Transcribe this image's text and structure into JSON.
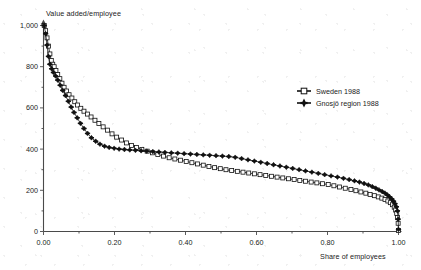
{
  "chart_data": {
    "type": "line",
    "title": "",
    "subtitle": "",
    "xlabel": "Share of employees",
    "ylabel": "Value added/employee",
    "xlim": [
      0.0,
      1.0
    ],
    "ylim": [
      0,
      1000
    ],
    "grid": false,
    "legend_position": "upper-right-inside",
    "xticks": [
      0.0,
      0.2,
      0.4,
      0.6,
      0.8,
      1.0
    ],
    "xtick_labels": [
      "0.00",
      "0.20",
      "0.40",
      "0.60",
      "0.80",
      "1.00"
    ],
    "yticks": [
      0,
      200,
      400,
      600,
      800,
      1000
    ],
    "ytick_labels": [
      "0",
      "200",
      "400",
      "600",
      "800",
      "1,000"
    ],
    "xminorticks": [
      0.1,
      0.3,
      0.5,
      0.7,
      0.9
    ],
    "yminorticks": [
      100,
      300,
      500,
      700,
      900
    ],
    "series": [
      {
        "name": "Sweden 1988",
        "marker": "open-square",
        "color": "#1d1d1d",
        "x": [
          0.002,
          0.006,
          0.01,
          0.014,
          0.018,
          0.022,
          0.026,
          0.03,
          0.035,
          0.04,
          0.046,
          0.052,
          0.058,
          0.065,
          0.072,
          0.08,
          0.088,
          0.096,
          0.105,
          0.114,
          0.124,
          0.134,
          0.145,
          0.156,
          0.168,
          0.18,
          0.193,
          0.206,
          0.22,
          0.234,
          0.248,
          0.262,
          0.277,
          0.292,
          0.307,
          0.322,
          0.338,
          0.354,
          0.37,
          0.386,
          0.402,
          0.418,
          0.434,
          0.45,
          0.466,
          0.482,
          0.498,
          0.514,
          0.53,
          0.546,
          0.562,
          0.578,
          0.594,
          0.61,
          0.626,
          0.642,
          0.658,
          0.674,
          0.69,
          0.706,
          0.722,
          0.738,
          0.754,
          0.77,
          0.786,
          0.802,
          0.818,
          0.834,
          0.85,
          0.866,
          0.88,
          0.894,
          0.908,
          0.92,
          0.932,
          0.943,
          0.953,
          0.962,
          0.97,
          0.977,
          0.983,
          0.988,
          0.992,
          0.995,
          0.997,
          0.999,
          1.0
        ],
        "y": [
          1000,
          975,
          940,
          900,
          862,
          830,
          812,
          800,
          782,
          762,
          742,
          720,
          700,
          682,
          664,
          648,
          630,
          614,
          598,
          584,
          570,
          556,
          540,
          524,
          508,
          492,
          474,
          458,
          444,
          430,
          418,
          408,
          398,
          390,
          382,
          374,
          366,
          358,
          352,
          346,
          340,
          334,
          328,
          322,
          316,
          310,
          305,
          300,
          296,
          292,
          288,
          284,
          280,
          276,
          272,
          268,
          264,
          260,
          256,
          252,
          248,
          244,
          240,
          236,
          232,
          228,
          222,
          216,
          210,
          204,
          198,
          192,
          186,
          180,
          174,
          168,
          162,
          155,
          148,
          140,
          130,
          118,
          104,
          88,
          68,
          40,
          5
        ]
      },
      {
        "name": "Gnosjö region 1988",
        "marker": "filled-plus",
        "color": "#111111",
        "x": [
          0.002,
          0.006,
          0.01,
          0.014,
          0.018,
          0.023,
          0.028,
          0.034,
          0.04,
          0.047,
          0.054,
          0.062,
          0.07,
          0.078,
          0.086,
          0.095,
          0.104,
          0.114,
          0.124,
          0.135,
          0.147,
          0.159,
          0.172,
          0.185,
          0.199,
          0.213,
          0.228,
          0.243,
          0.259,
          0.275,
          0.291,
          0.308,
          0.325,
          0.342,
          0.36,
          0.378,
          0.396,
          0.414,
          0.432,
          0.45,
          0.468,
          0.486,
          0.504,
          0.522,
          0.54,
          0.558,
          0.576,
          0.594,
          0.612,
          0.63,
          0.648,
          0.666,
          0.684,
          0.702,
          0.72,
          0.738,
          0.756,
          0.774,
          0.792,
          0.81,
          0.828,
          0.845,
          0.861,
          0.876,
          0.89,
          0.903,
          0.915,
          0.926,
          0.936,
          0.945,
          0.954,
          0.962,
          0.969,
          0.975,
          0.981,
          0.986,
          0.99,
          0.994,
          0.997,
          0.999,
          1.0
        ],
        "y": [
          1000,
          960,
          905,
          850,
          812,
          790,
          772,
          755,
          735,
          710,
          685,
          660,
          632,
          604,
          578,
          552,
          525,
          500,
          476,
          455,
          438,
          424,
          414,
          408,
          404,
          400,
          398,
          396,
          394,
          392,
          390,
          388,
          386,
          384,
          382,
          380,
          378,
          376,
          374,
          372,
          370,
          368,
          366,
          364,
          360,
          354,
          348,
          342,
          336,
          330,
          324,
          318,
          312,
          306,
          300,
          294,
          288,
          282,
          276,
          270,
          264,
          258,
          252,
          246,
          240,
          233,
          226,
          218,
          210,
          202,
          194,
          186,
          177,
          168,
          158,
          147,
          135,
          120,
          100,
          60,
          10
        ]
      }
    ]
  },
  "legend": {
    "items": [
      {
        "label": "Sweden 1988",
        "marker": "open-square"
      },
      {
        "label": "Gnosjö region 1988",
        "marker": "filled-plus"
      }
    ]
  }
}
